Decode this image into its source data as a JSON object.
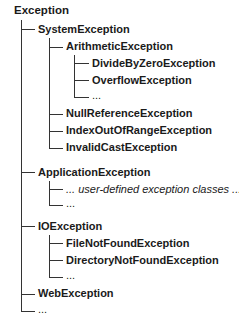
{
  "diagram": {
    "root": "Exception",
    "nodes": [
      {
        "id": "system",
        "label": "SystemException",
        "level": 1
      },
      {
        "id": "arith",
        "label": "ArithmeticException",
        "level": 2
      },
      {
        "id": "divzero",
        "label": "DivideByZeroException",
        "level": 3
      },
      {
        "id": "overflow",
        "label": "OverflowException",
        "level": 3
      },
      {
        "id": "arith_more",
        "label": "...",
        "level": 3
      },
      {
        "id": "nullref",
        "label": "NullReferenceException",
        "level": 2
      },
      {
        "id": "index",
        "label": "IndexOutOfRangeException",
        "level": 2
      },
      {
        "id": "invalidcast",
        "label": "InvalidCastException",
        "level": 2
      },
      {
        "id": "application",
        "label": "ApplicationException",
        "level": 1
      },
      {
        "id": "userdefined",
        "label": "... user-defined exception classes ...",
        "level": 2
      },
      {
        "id": "app_more",
        "label": "...",
        "level": 2
      },
      {
        "id": "io",
        "label": "IOException",
        "level": 1
      },
      {
        "id": "filenotfound",
        "label": "FileNotFoundException",
        "level": 2
      },
      {
        "id": "dirnotfound",
        "label": "DirectoryNotFoundException",
        "level": 2
      },
      {
        "id": "io_more",
        "label": "...",
        "level": 2
      },
      {
        "id": "web",
        "label": "WebException",
        "level": 1
      },
      {
        "id": "root_more",
        "label": "...",
        "level": 1
      }
    ],
    "colors": {
      "line": "#333333",
      "text": "#1a1a1a"
    }
  }
}
